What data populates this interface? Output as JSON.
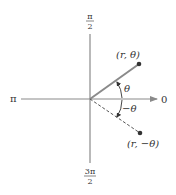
{
  "diagram": {
    "axis_labels": {
      "top": {
        "num": "π",
        "den": "2"
      },
      "left": "π",
      "right": "0",
      "bottom": {
        "num": "3π",
        "den": "2"
      }
    },
    "points": [
      {
        "id": "p1",
        "label": "(r, θ)",
        "x": 139,
        "y": 64
      },
      {
        "id": "p2",
        "label": "(r, −θ)",
        "x": 140,
        "y": 133
      }
    ],
    "angle_labels": {
      "positive": "θ",
      "negative": "−θ"
    },
    "colors": {
      "axis": "#8a8a8a",
      "ray": "#8a8a8a",
      "dashed": "#555555",
      "point": "#333333",
      "text": "#333333"
    },
    "origin": {
      "x": 90,
      "y": 99
    }
  }
}
